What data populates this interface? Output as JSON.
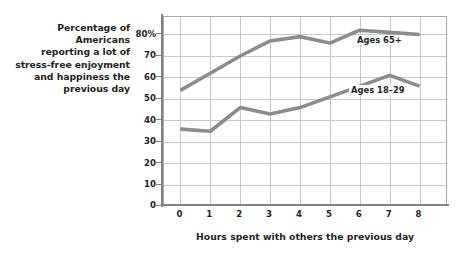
{
  "caption": {
    "lines": [
      "Percentage of Americans",
      "reporting a lot of",
      "stress-free enjoyment",
      "and happiness the",
      "previous day"
    ],
    "full_text": "Percentage of Americans reporting a lot of stress-free enjoyment and happiness the previous day"
  },
  "chart_data": {
    "type": "line",
    "title": "",
    "subtitle": "",
    "xlabel": "Hours spent with others the previous day",
    "ylabel": "Percentage of Americans reporting a lot of stress-free enjoyment and happiness the previous day",
    "x": [
      0,
      1,
      2,
      3,
      4,
      5,
      6,
      7,
      8
    ],
    "categories": [
      "0",
      "1",
      "2",
      "3",
      "4",
      "5",
      "6",
      "7",
      "8"
    ],
    "xtick_labels": [
      "0",
      "1",
      "2",
      "3",
      "4",
      "5",
      "6",
      "7",
      "8"
    ],
    "ytick_labels": [
      "0",
      "10",
      "20",
      "30",
      "40",
      "50",
      "60",
      "70",
      "80%"
    ],
    "ytick_values": [
      0,
      10,
      20,
      30,
      40,
      50,
      60,
      70,
      80
    ],
    "xlim": [
      -0.55,
      9.0
    ],
    "ylim": [
      0,
      89
    ],
    "grid": true,
    "legend_position": "inline-annotation",
    "series": [
      {
        "name": "Ages 65+",
        "label": "Ages 65+",
        "color": "#8a8c8e",
        "values": [
          44,
          52,
          60,
          67,
          69,
          66,
          72,
          71,
          70
        ]
      },
      {
        "name": "Ages 18-29",
        "label": "Ages 18–29",
        "color": "#8a8c8e",
        "values": [
          26,
          25,
          36,
          33,
          36,
          41,
          46,
          51,
          46
        ]
      }
    ],
    "annotations": [
      {
        "text": "Ages 65+",
        "x": 6,
        "y": 78
      },
      {
        "text": "Ages 18–29",
        "x": 6,
        "y": 56
      }
    ]
  },
  "colors": {
    "line": "#8a8c8e",
    "grid": "#c9cacc",
    "axis": "#808285",
    "text": "#231f20",
    "background": "#ffffff"
  }
}
